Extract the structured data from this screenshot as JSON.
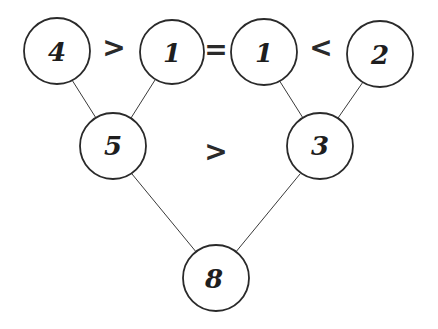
{
  "diagram": {
    "type": "comparison-tree",
    "nodes": [
      {
        "id": "n4",
        "value": "4",
        "cx": 57,
        "cy": 51
      },
      {
        "id": "n1a",
        "value": "1",
        "cx": 172,
        "cy": 52
      },
      {
        "id": "n1b",
        "value": "1",
        "cx": 264,
        "cy": 52
      },
      {
        "id": "n2",
        "value": "2",
        "cx": 380,
        "cy": 54
      },
      {
        "id": "n5",
        "value": "5",
        "cx": 113,
        "cy": 146
      },
      {
        "id": "n3",
        "value": "3",
        "cx": 320,
        "cy": 146
      },
      {
        "id": "n8",
        "value": "8",
        "cx": 216,
        "cy": 278
      }
    ],
    "edges": [
      {
        "from": "n4",
        "to": "n5"
      },
      {
        "from": "n1a",
        "to": "n5"
      },
      {
        "from": "n1b",
        "to": "n3"
      },
      {
        "from": "n2",
        "to": "n3"
      },
      {
        "from": "n5",
        "to": "n8"
      },
      {
        "from": "n3",
        "to": "n8"
      }
    ],
    "operators": [
      {
        "id": "op1",
        "symbol": ">",
        "between": [
          "n4",
          "n1a"
        ],
        "x": 114,
        "y": 48
      },
      {
        "id": "op2",
        "symbol": "=",
        "between": [
          "n1a",
          "n1b"
        ],
        "x": 216,
        "y": 50
      },
      {
        "id": "op3",
        "symbol": "<",
        "between": [
          "n1b",
          "n2"
        ],
        "x": 321,
        "y": 48
      },
      {
        "id": "op4",
        "symbol": ">",
        "between": [
          "n5",
          "n3"
        ],
        "x": 216,
        "y": 152
      }
    ],
    "radius": 33
  }
}
